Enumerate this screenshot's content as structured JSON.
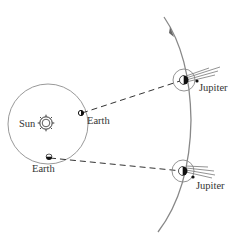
{
  "diagram": {
    "labels": {
      "sun": "Sun",
      "earth_1": "Earth",
      "earth_2": "Earth",
      "jupiter_1": "Jupiter",
      "jupiter_2": "Jupiter"
    },
    "colors": {
      "orbit": "#999999",
      "jupiter_orbit": "#888888",
      "body": "#111111",
      "dashed_line": "#333333",
      "text": "#333333"
    }
  }
}
